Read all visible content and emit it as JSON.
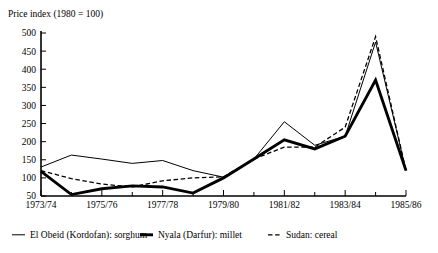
{
  "chart_data": {
    "type": "line",
    "title": "Price index (1980 = 100)",
    "xlabel": "",
    "ylabel": "",
    "ylim": [
      50,
      500
    ],
    "ytick_step": 50,
    "yticks": [
      50,
      100,
      150,
      200,
      250,
      300,
      350,
      400,
      450,
      500
    ],
    "ytick_labels": [
      "50",
      "100",
      "150",
      "200",
      "250",
      "300",
      "350",
      "400",
      "450",
      "500"
    ],
    "x": [
      "1973/74",
      "1974/75",
      "1975/76",
      "1976/77",
      "1977/78",
      "1978/79",
      "1979/80",
      "1980/81",
      "1981/82",
      "1982/83",
      "1983/84",
      "1984/85",
      "1985/86"
    ],
    "xtick_labels_shown": [
      "1973/74",
      "1975/76",
      "1977/78",
      "1979/80",
      "1981/82",
      "1983/84",
      "1985/86"
    ],
    "xtick_label_indices": [
      0,
      2,
      4,
      6,
      8,
      10,
      12
    ],
    "grid": false,
    "legend_position": "bottom",
    "series": [
      {
        "name": "El Obeid (Kordofan): sorghum",
        "style": "thin-solid",
        "color": "#000000",
        "values": [
          130,
          163,
          152,
          140,
          148,
          120,
          102,
          152,
          255,
          190,
          215,
          475,
          120
        ]
      },
      {
        "name": "Nyala (Darfur): millet",
        "style": "thick-solid",
        "color": "#000000",
        "values": [
          118,
          54,
          70,
          78,
          75,
          58,
          100,
          152,
          205,
          180,
          215,
          370,
          120
        ]
      },
      {
        "name": "Sudan: cereal",
        "style": "dashed",
        "color": "#000000",
        "values": [
          120,
          98,
          83,
          75,
          92,
          100,
          103,
          152,
          185,
          185,
          240,
          490,
          120
        ]
      }
    ]
  },
  "legend": {
    "items": [
      {
        "label": "El Obeid (Kordofan): sorghum",
        "style": "thin-solid"
      },
      {
        "label": "Nyala (Darfur): millet",
        "style": "thick-solid"
      },
      {
        "label": "Sudan: cereal",
        "style": "dashed"
      }
    ]
  }
}
